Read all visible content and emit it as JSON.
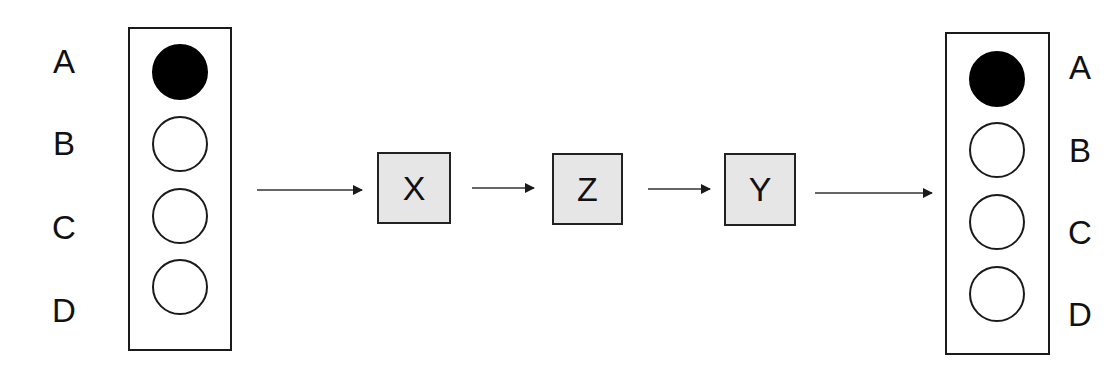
{
  "diagram": {
    "left_register": {
      "labels": [
        "A",
        "B",
        "C",
        "D"
      ],
      "states": [
        "filled",
        "empty",
        "empty",
        "empty"
      ]
    },
    "operations": [
      {
        "label": "X"
      },
      {
        "label": "Z"
      },
      {
        "label": "Y"
      }
    ],
    "right_register": {
      "labels": [
        "A",
        "B",
        "C",
        "D"
      ],
      "states": [
        "filled",
        "empty",
        "empty",
        "empty"
      ]
    },
    "colors": {
      "node_fill": "#e6e6e6",
      "stroke": "#1a1a1a",
      "filled_circle": "#000000",
      "background": "#ffffff"
    }
  }
}
